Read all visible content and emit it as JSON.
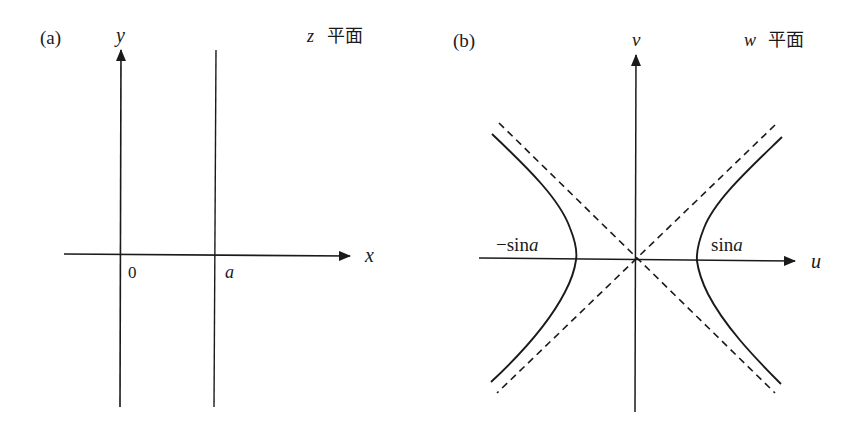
{
  "figure": {
    "panel_a": {
      "tag": "(a)",
      "plane_var": "z",
      "plane_word": "平面",
      "x_axis_label": "x",
      "y_axis_label": "y",
      "origin_label": "0",
      "line_label": "a",
      "description": "Vertical line x = a in the z-plane"
    },
    "panel_b": {
      "tag": "(b)",
      "plane_var": "w",
      "plane_word": "平面",
      "u_axis_label": "u",
      "v_axis_label": "v",
      "left_vertex_label": "−sin",
      "left_vertex_var": "a",
      "right_vertex_label": "sin",
      "right_vertex_var": "a",
      "description": "Hyperbola with dashed asymptotes in the w-plane"
    },
    "colors": {
      "stroke": "#1a1a1a",
      "background": "#ffffff"
    }
  }
}
